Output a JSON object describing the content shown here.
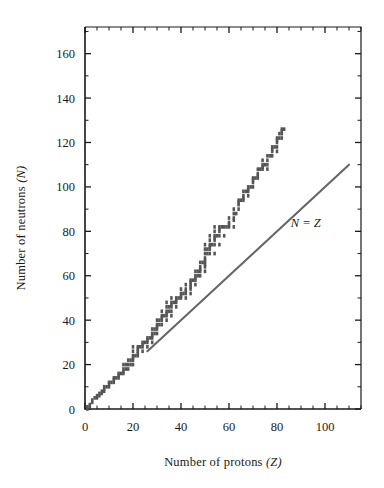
{
  "figure": {
    "title": "",
    "axis_labels": {
      "x_main": "Number of protons",
      "x_symbol": "(Z)",
      "y_main": "Number of neutrons",
      "y_symbol": "(N)"
    },
    "colors": {
      "band": "#555555",
      "line": "#666666",
      "axis": "#1a1a1a",
      "background": "#ffffff"
    }
  },
  "chart_data": {
    "type": "scatter",
    "title": "",
    "subtitle": "",
    "xlabel": "Number of protons (Z)",
    "ylabel": "Number of neutrons (N)",
    "xlim": [
      0,
      115
    ],
    "ylim": [
      0,
      172
    ],
    "grid": false,
    "legend_position": "none",
    "x_ticks_major": [
      0,
      20,
      40,
      60,
      80,
      100
    ],
    "x_tick_labels": [
      "0",
      "20",
      "40",
      "60",
      "80",
      "100"
    ],
    "x_tick_minor_step": 5,
    "y_ticks_major": [
      0,
      20,
      40,
      60,
      80,
      100,
      120,
      140,
      160
    ],
    "y_tick_labels": [
      "0",
      "20",
      "40",
      "60",
      "80",
      "100",
      "120",
      "140",
      "160"
    ],
    "y_tick_minor_step": 10,
    "annotations": [
      {
        "text": "N = Z",
        "x": 92,
        "y": 82,
        "style": "italic"
      }
    ],
    "series": [
      {
        "name": "Band of stability",
        "marker": "square",
        "color": "#555555",
        "description": "Stable nuclides: N vs Z staircase band",
        "points": [
          [
            1,
            0
          ],
          [
            1,
            1
          ],
          [
            2,
            1
          ],
          [
            2,
            2
          ],
          [
            3,
            3
          ],
          [
            3,
            4
          ],
          [
            4,
            5
          ],
          [
            5,
            5
          ],
          [
            5,
            6
          ],
          [
            6,
            6
          ],
          [
            6,
            7
          ],
          [
            7,
            7
          ],
          [
            7,
            8
          ],
          [
            8,
            8
          ],
          [
            8,
            9
          ],
          [
            8,
            10
          ],
          [
            9,
            10
          ],
          [
            10,
            10
          ],
          [
            10,
            11
          ],
          [
            10,
            12
          ],
          [
            11,
            12
          ],
          [
            12,
            12
          ],
          [
            12,
            13
          ],
          [
            12,
            14
          ],
          [
            13,
            14
          ],
          [
            14,
            14
          ],
          [
            14,
            15
          ],
          [
            14,
            16
          ],
          [
            15,
            16
          ],
          [
            16,
            16
          ],
          [
            16,
            17
          ],
          [
            16,
            18
          ],
          [
            16,
            20
          ],
          [
            17,
            18
          ],
          [
            17,
            20
          ],
          [
            18,
            18
          ],
          [
            18,
            20
          ],
          [
            18,
            22
          ],
          [
            19,
            20
          ],
          [
            19,
            22
          ],
          [
            20,
            20
          ],
          [
            20,
            22
          ],
          [
            20,
            23
          ],
          [
            20,
            24
          ],
          [
            20,
            26
          ],
          [
            20,
            28
          ],
          [
            21,
            24
          ],
          [
            22,
            24
          ],
          [
            22,
            25
          ],
          [
            22,
            26
          ],
          [
            22,
            27
          ],
          [
            22,
            28
          ],
          [
            23,
            28
          ],
          [
            24,
            26
          ],
          [
            24,
            28
          ],
          [
            24,
            29
          ],
          [
            24,
            30
          ],
          [
            25,
            30
          ],
          [
            26,
            28
          ],
          [
            26,
            30
          ],
          [
            26,
            31
          ],
          [
            26,
            32
          ],
          [
            27,
            32
          ],
          [
            28,
            30
          ],
          [
            28,
            32
          ],
          [
            28,
            33
          ],
          [
            28,
            34
          ],
          [
            28,
            36
          ],
          [
            29,
            34
          ],
          [
            29,
            36
          ],
          [
            30,
            34
          ],
          [
            30,
            36
          ],
          [
            30,
            37
          ],
          [
            30,
            38
          ],
          [
            30,
            40
          ],
          [
            31,
            38
          ],
          [
            31,
            40
          ],
          [
            32,
            38
          ],
          [
            32,
            40
          ],
          [
            32,
            41
          ],
          [
            32,
            42
          ],
          [
            32,
            44
          ],
          [
            33,
            42
          ],
          [
            34,
            40
          ],
          [
            34,
            42
          ],
          [
            34,
            43
          ],
          [
            34,
            44
          ],
          [
            34,
            46
          ],
          [
            34,
            48
          ],
          [
            35,
            44
          ],
          [
            35,
            46
          ],
          [
            36,
            42
          ],
          [
            36,
            44
          ],
          [
            36,
            46
          ],
          [
            36,
            47
          ],
          [
            36,
            48
          ],
          [
            36,
            50
          ],
          [
            37,
            48
          ],
          [
            38,
            46
          ],
          [
            38,
            48
          ],
          [
            38,
            49
          ],
          [
            38,
            50
          ],
          [
            39,
            50
          ],
          [
            40,
            50
          ],
          [
            40,
            51
          ],
          [
            40,
            52
          ],
          [
            40,
            54
          ],
          [
            41,
            52
          ],
          [
            42,
            50
          ],
          [
            42,
            52
          ],
          [
            42,
            53
          ],
          [
            42,
            54
          ],
          [
            42,
            56
          ],
          [
            44,
            52
          ],
          [
            44,
            54
          ],
          [
            44,
            55
          ],
          [
            44,
            56
          ],
          [
            44,
            57
          ],
          [
            44,
            58
          ],
          [
            45,
            58
          ],
          [
            46,
            56
          ],
          [
            46,
            58
          ],
          [
            46,
            59
          ],
          [
            46,
            60
          ],
          [
            46,
            62
          ],
          [
            47,
            60
          ],
          [
            47,
            62
          ],
          [
            48,
            60
          ],
          [
            48,
            62
          ],
          [
            48,
            63
          ],
          [
            48,
            64
          ],
          [
            48,
            66
          ],
          [
            49,
            66
          ],
          [
            50,
            62
          ],
          [
            50,
            64
          ],
          [
            50,
            65
          ],
          [
            50,
            66
          ],
          [
            50,
            67
          ],
          [
            50,
            68
          ],
          [
            50,
            70
          ],
          [
            50,
            72
          ],
          [
            50,
            74
          ],
          [
            51,
            70
          ],
          [
            51,
            72
          ],
          [
            52,
            70
          ],
          [
            52,
            72
          ],
          [
            52,
            73
          ],
          [
            52,
            74
          ],
          [
            52,
            76
          ],
          [
            52,
            78
          ],
          [
            53,
            74
          ],
          [
            54,
            70
          ],
          [
            54,
            74
          ],
          [
            54,
            76
          ],
          [
            54,
            77
          ],
          [
            54,
            78
          ],
          [
            54,
            80
          ],
          [
            54,
            82
          ],
          [
            55,
            78
          ],
          [
            56,
            74
          ],
          [
            56,
            78
          ],
          [
            56,
            80
          ],
          [
            56,
            81
          ],
          [
            56,
            82
          ],
          [
            57,
            82
          ],
          [
            58,
            78
          ],
          [
            58,
            82
          ],
          [
            59,
            82
          ],
          [
            60,
            82
          ],
          [
            60,
            83
          ],
          [
            60,
            84
          ],
          [
            60,
            86
          ],
          [
            62,
            82
          ],
          [
            62,
            85
          ],
          [
            62,
            86
          ],
          [
            62,
            88
          ],
          [
            62,
            90
          ],
          [
            63,
            88
          ],
          [
            64,
            90
          ],
          [
            64,
            92
          ],
          [
            64,
            93
          ],
          [
            64,
            94
          ],
          [
            65,
            94
          ],
          [
            66,
            94
          ],
          [
            66,
            95
          ],
          [
            66,
            96
          ],
          [
            66,
            98
          ],
          [
            67,
            98
          ],
          [
            68,
            96
          ],
          [
            68,
            98
          ],
          [
            68,
            99
          ],
          [
            68,
            100
          ],
          [
            69,
            100
          ],
          [
            70,
            100
          ],
          [
            70,
            102
          ],
          [
            70,
            103
          ],
          [
            70,
            104
          ],
          [
            71,
            104
          ],
          [
            72,
            104
          ],
          [
            72,
            105
          ],
          [
            72,
            106
          ],
          [
            72,
            108
          ],
          [
            73,
            108
          ],
          [
            74,
            108
          ],
          [
            74,
            109
          ],
          [
            74,
            110
          ],
          [
            74,
            112
          ],
          [
            75,
            110
          ],
          [
            76,
            108
          ],
          [
            76,
            110
          ],
          [
            76,
            112
          ],
          [
            76,
            114
          ],
          [
            77,
            114
          ],
          [
            78,
            114
          ],
          [
            78,
            116
          ],
          [
            78,
            117
          ],
          [
            78,
            118
          ],
          [
            79,
            118
          ],
          [
            80,
            116
          ],
          [
            80,
            118
          ],
          [
            80,
            120
          ],
          [
            80,
            121
          ],
          [
            80,
            122
          ],
          [
            81,
            122
          ],
          [
            81,
            124
          ],
          [
            82,
            122
          ],
          [
            82,
            124
          ],
          [
            82,
            125
          ],
          [
            82,
            126
          ],
          [
            83,
            126
          ]
        ]
      },
      {
        "name": "N = Z reference line",
        "marker": "line",
        "color": "#666666",
        "x_start": 26,
        "y_start": 26,
        "x_end": 110,
        "y_end": 110
      }
    ]
  }
}
